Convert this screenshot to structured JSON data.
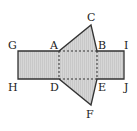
{
  "diagram": {
    "title": "",
    "colors": {
      "fill": "#d2d2d2",
      "stroke": "#333333",
      "background": "#ffffff"
    },
    "labels": {
      "A": "A",
      "B": "B",
      "C": "C",
      "D": "D",
      "E": "E",
      "F": "F",
      "G": "G",
      "H": "H",
      "I": "I",
      "J": "J"
    },
    "points": {
      "A": [
        59,
        51
      ],
      "B": [
        97,
        51
      ],
      "C": [
        91,
        25
      ],
      "D": [
        59,
        79
      ],
      "E": [
        97,
        79
      ],
      "F": [
        91,
        105
      ],
      "G": [
        18,
        51
      ],
      "H": [
        18,
        79
      ],
      "I": [
        124,
        51
      ],
      "J": [
        124,
        79
      ]
    }
  }
}
